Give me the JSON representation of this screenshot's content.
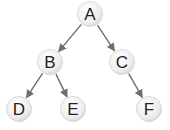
{
  "diagram": {
    "type": "binary-tree",
    "nodes": [
      {
        "id": "A",
        "label": "A",
        "x": 90,
        "y": 14
      },
      {
        "id": "B",
        "label": "B",
        "x": 50,
        "y": 62
      },
      {
        "id": "C",
        "label": "C",
        "x": 122,
        "y": 62
      },
      {
        "id": "D",
        "label": "D",
        "x": 19,
        "y": 109
      },
      {
        "id": "E",
        "label": "E",
        "x": 73,
        "y": 109
      },
      {
        "id": "F",
        "label": "F",
        "x": 149,
        "y": 109
      }
    ],
    "edges": [
      {
        "from": "A",
        "to": "B"
      },
      {
        "from": "A",
        "to": "C"
      },
      {
        "from": "B",
        "to": "D"
      },
      {
        "from": "B",
        "to": "E"
      },
      {
        "from": "C",
        "to": "F"
      }
    ],
    "colors": {
      "edge": "#6e6e6e",
      "node_fill": "#ececec",
      "node_edge": "#d0d0d0"
    }
  }
}
